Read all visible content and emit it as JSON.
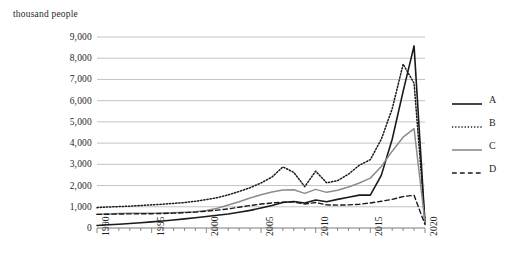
{
  "chart_data": {
    "type": "line",
    "title": "",
    "subtitle": "",
    "xlabel": "",
    "ylabel": "thousand people",
    "unit_label": "thousand people",
    "grid": true,
    "legend_position": "right",
    "xlim": [
      1990,
      2020
    ],
    "ylim": [
      0,
      9000
    ],
    "ytick_step": 1000,
    "ytick_labels": [
      "0",
      "1,000",
      "2,000",
      "3,000",
      "4,000",
      "5,000",
      "6,000",
      "7,000",
      "8,000",
      "9,000"
    ],
    "ytick_values": [
      0,
      1000,
      2000,
      3000,
      4000,
      5000,
      6000,
      7000,
      8000,
      9000
    ],
    "xtick_labels": [
      "1990",
      "1995",
      "2000",
      "2005",
      "2010",
      "2015",
      "2020"
    ],
    "xtick_values": [
      1990,
      1995,
      2000,
      2005,
      2010,
      2015,
      2020
    ],
    "x": [
      1990,
      1991,
      1992,
      1993,
      1994,
      1995,
      1996,
      1997,
      1998,
      1999,
      2000,
      2001,
      2002,
      2003,
      2004,
      2005,
      2006,
      2007,
      2008,
      2009,
      2010,
      2011,
      2012,
      2013,
      2014,
      2015,
      2016,
      2017,
      2018,
      2019,
      2020
    ],
    "series": [
      {
        "name": "A",
        "style": "solid",
        "color": "#1a1a1a",
        "width": 1.6,
        "values": [
          120,
          150,
          180,
          210,
          250,
          290,
          330,
          380,
          430,
          480,
          540,
          600,
          660,
          740,
          830,
          940,
          1060,
          1200,
          1250,
          1180,
          1320,
          1240,
          1350,
          1450,
          1550,
          1550,
          2480,
          4180,
          6440,
          8580,
          220
        ]
      },
      {
        "name": "B",
        "style": "dotted",
        "color": "#1a1a1a",
        "width": 1.5,
        "values": [
          960,
          990,
          1010,
          1030,
          1060,
          1090,
          1120,
          1160,
          1200,
          1260,
          1340,
          1430,
          1560,
          1720,
          1900,
          2120,
          2400,
          2880,
          2620,
          1950,
          2680,
          2130,
          2230,
          2540,
          2960,
          3220,
          4180,
          5620,
          7720,
          6820,
          320
        ]
      },
      {
        "name": "C",
        "style": "solid",
        "color": "#8c8c8c",
        "width": 1.5,
        "values": [
          650,
          665,
          680,
          690,
          700,
          700,
          710,
          720,
          740,
          770,
          830,
          930,
          1080,
          1240,
          1410,
          1570,
          1700,
          1790,
          1800,
          1630,
          1820,
          1680,
          1780,
          1930,
          2120,
          2350,
          2900,
          3620,
          4280,
          4680,
          260
        ]
      },
      {
        "name": "D",
        "style": "dashed",
        "color": "#1a1a1a",
        "width": 1.4,
        "values": [
          640,
          650,
          660,
          665,
          670,
          675,
          685,
          700,
          720,
          750,
          790,
          840,
          900,
          980,
          1060,
          1130,
          1180,
          1220,
          1230,
          1130,
          1200,
          1090,
          1080,
          1090,
          1120,
          1180,
          1260,
          1350,
          1480,
          1540,
          160
        ]
      }
    ],
    "legend": [
      {
        "label": "A",
        "style": "solid",
        "color": "#1a1a1a"
      },
      {
        "label": "B",
        "style": "dotted",
        "color": "#1a1a1a"
      },
      {
        "label": "C",
        "style": "solid",
        "color": "#8c8c8c"
      },
      {
        "label": "D",
        "style": "dashed",
        "color": "#1a1a1a"
      }
    ],
    "colors": {
      "grid": "#b4b4b4",
      "axis": "#6b6b6b",
      "text": "#1f1f1f",
      "series_a": "#1a1a1a",
      "series_b": "#1a1a1a",
      "series_c": "#8c8c8c",
      "series_d": "#1a1a1a"
    }
  }
}
